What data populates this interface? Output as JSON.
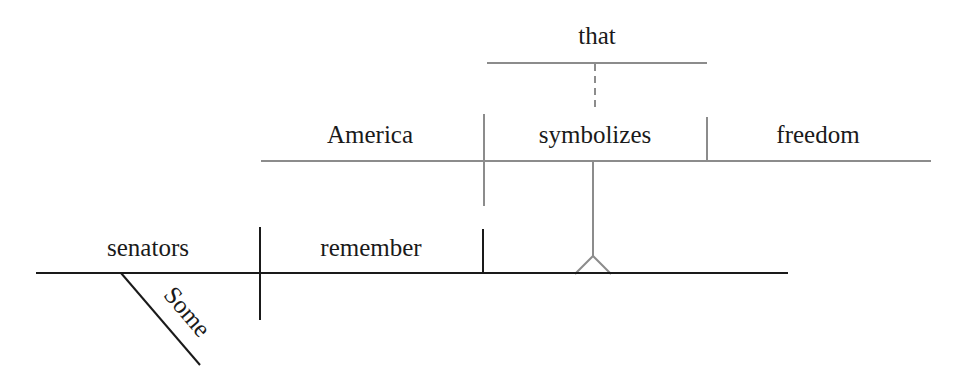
{
  "diagram": {
    "type": "sentence-diagram (Reed-Kellogg)",
    "sentence_words": [
      "Some",
      "senators",
      "remember",
      "that",
      "America",
      "symbolizes",
      "freedom"
    ],
    "main_clause": {
      "subject": "senators",
      "verb": "remember",
      "subject_modifier": "Some",
      "direct_object": "noun clause (on pedestal)"
    },
    "noun_clause": {
      "connector": "that",
      "subject": "America",
      "verb": "symbolizes",
      "direct_object": "freedom"
    },
    "colors": {
      "main_lines": "#1a1a1a",
      "clause_lines": "#8c8c8c",
      "text": "#1a1a1a",
      "background": "#ffffff"
    }
  }
}
